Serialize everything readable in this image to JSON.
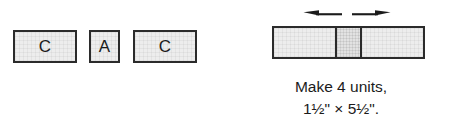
{
  "diagram": {
    "title": "Make 4 units, 1½\" × 5½\".",
    "colors": {
      "outline": "#2b2b2b",
      "fabric_fill": "#ededed",
      "fabric_fill_accent": "#e2e2e2",
      "text": "#1b1b1b",
      "background": "#ffffff"
    },
    "cut_pieces": {
      "group_name": "cut-pieces-row",
      "pieces": [
        {
          "label": "C",
          "shape": "rectangle",
          "orientation": "horizontal"
        },
        {
          "label": "A",
          "shape": "square",
          "orientation": "square"
        },
        {
          "label": "C",
          "shape": "rectangle",
          "orientation": "horizontal"
        }
      ]
    },
    "assembled_unit": {
      "group_name": "assembled-strip",
      "segments": [
        {
          "label": "C",
          "width_class": "wide"
        },
        {
          "label": "A",
          "width_class": "narrow"
        },
        {
          "label": "C",
          "width_class": "wide"
        }
      ],
      "press_arrows": {
        "icon": "press-seams-outward-arrows",
        "left_arrow": {
          "icon": "arrow-left-icon",
          "direction": "left"
        },
        "right_arrow": {
          "icon": "arrow-right-icon",
          "direction": "right"
        }
      },
      "caption": {
        "line1": "Make 4 units,",
        "line2": "1½\" × 5½\"."
      }
    }
  }
}
